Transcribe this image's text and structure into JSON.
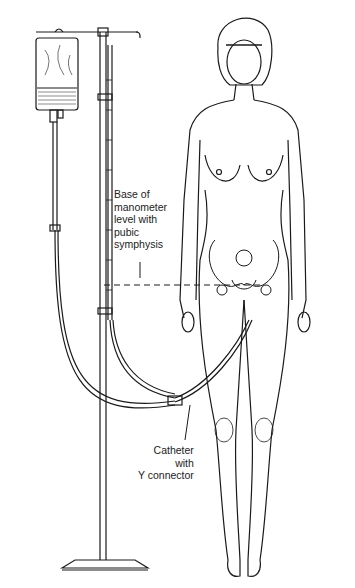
{
  "figure": {
    "type": "medical line illustration"
  },
  "labels": {
    "base": {
      "lines": [
        "Base of",
        "manometer",
        "level with",
        "pubic",
        "symphysis"
      ]
    },
    "catheter": {
      "lines": [
        "Catheter",
        "with",
        "Y connector"
      ]
    }
  },
  "colors": {
    "ink": "#1a1a1a",
    "background": "#ffffff"
  }
}
